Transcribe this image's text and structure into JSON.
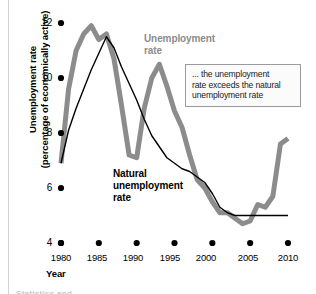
{
  "chart_data": {
    "type": "line",
    "title": "",
    "xlabel": "Year",
    "ylabel": "Unemployment rate (percentage of economically active)",
    "xlim": [
      1980,
      2010
    ],
    "ylim": [
      4,
      12
    ],
    "grid": false,
    "legend_position": "inline-annotations",
    "xticks": [
      1980,
      1985,
      1990,
      1995,
      2000,
      2005,
      2010
    ],
    "xtick_labels": [
      "1980",
      "1985",
      "1990",
      "1995",
      "2000",
      "2005",
      "2010"
    ],
    "yticks": [
      4,
      6,
      8,
      10,
      12
    ],
    "ytick_labels": [
      "4",
      "6",
      "8",
      "10",
      "12"
    ],
    "series": [
      {
        "name": "Unemployment rate",
        "color": "#8c8c8c",
        "linewidth": 5,
        "x": [
          1980,
          1981,
          1982,
          1983,
          1984,
          1985,
          1986,
          1987,
          1988,
          1989,
          1990,
          1991,
          1992,
          1993,
          1994,
          1995,
          1996,
          1997,
          1998,
          1999,
          2000,
          2001,
          2002,
          2003,
          2004,
          2005,
          2006,
          2007,
          2008,
          2009,
          2010
        ],
        "values": [
          6.9,
          9.6,
          11.0,
          11.6,
          11.9,
          11.4,
          11.6,
          10.7,
          9.0,
          7.2,
          7.1,
          8.9,
          10.0,
          10.5,
          9.7,
          8.8,
          8.2,
          7.2,
          6.3,
          6.0,
          5.5,
          5.1,
          5.1,
          4.9,
          4.7,
          4.8,
          5.4,
          5.3,
          5.7,
          7.6,
          7.8
        ]
      },
      {
        "name": "Natural unemployment rate",
        "color": "#000000",
        "linewidth": 1.4,
        "x": [
          1980,
          1981,
          1982,
          1983,
          1984,
          1985,
          1986,
          1987,
          1988,
          1989,
          1990,
          1991,
          1992,
          1993,
          1994,
          1995,
          1996,
          1997,
          1998,
          1999,
          2000,
          2001,
          2002,
          2003,
          2004,
          2005,
          2006,
          2007,
          2008,
          2009,
          2010
        ],
        "values": [
          6.9,
          8.1,
          8.9,
          9.6,
          10.3,
          10.9,
          11.5,
          11.1,
          10.4,
          9.8,
          9.2,
          8.5,
          7.9,
          7.5,
          7.1,
          6.9,
          6.7,
          6.6,
          6.4,
          6.2,
          5.8,
          5.3,
          5.1,
          5.0,
          5.0,
          5.0,
          5.0,
          5.0,
          5.0,
          5.0,
          5.0
        ]
      }
    ],
    "annotations": [
      {
        "name": "unemployment-rate-label",
        "text_lines": [
          "Unemployment",
          "rate"
        ],
        "color": "#8c8c8c"
      },
      {
        "name": "natural-unemployment-rate-label",
        "text_lines": [
          "Natural",
          "unemployment",
          "rate"
        ],
        "color": "#000000"
      },
      {
        "name": "callout",
        "text_lines": [
          "... the unemployment",
          "rate exceeds the natural",
          "unemployment rate"
        ],
        "color": "#1a1a1a"
      }
    ]
  },
  "axes": {
    "y_title_line1": "Unemployment rate",
    "y_title_line2": "(percentage of economically active)",
    "x_title": "Year"
  },
  "ticks": {
    "y": [
      "12",
      "10",
      "8",
      "6",
      "4"
    ],
    "x": [
      "1980",
      "1985",
      "1990",
      "1995",
      "2000",
      "2005",
      "2010"
    ]
  },
  "labels": {
    "unemployment_rate_l1": "Unemployment",
    "unemployment_rate_l2": "rate",
    "natural_l1": "Natural",
    "natural_l2": "unemployment",
    "natural_l3": "rate"
  },
  "callout": {
    "line1": "... the unemployment",
    "line2": "rate exceeds the natural",
    "line3": "unemployment rate"
  },
  "footer": {
    "clipped_caption": "Statistics and"
  },
  "colors": {
    "unemployment_series": "#8c8c8c",
    "natural_series": "#000000",
    "callout_border": "#9a9aa0",
    "callout_bg": "#fbfbfc"
  }
}
